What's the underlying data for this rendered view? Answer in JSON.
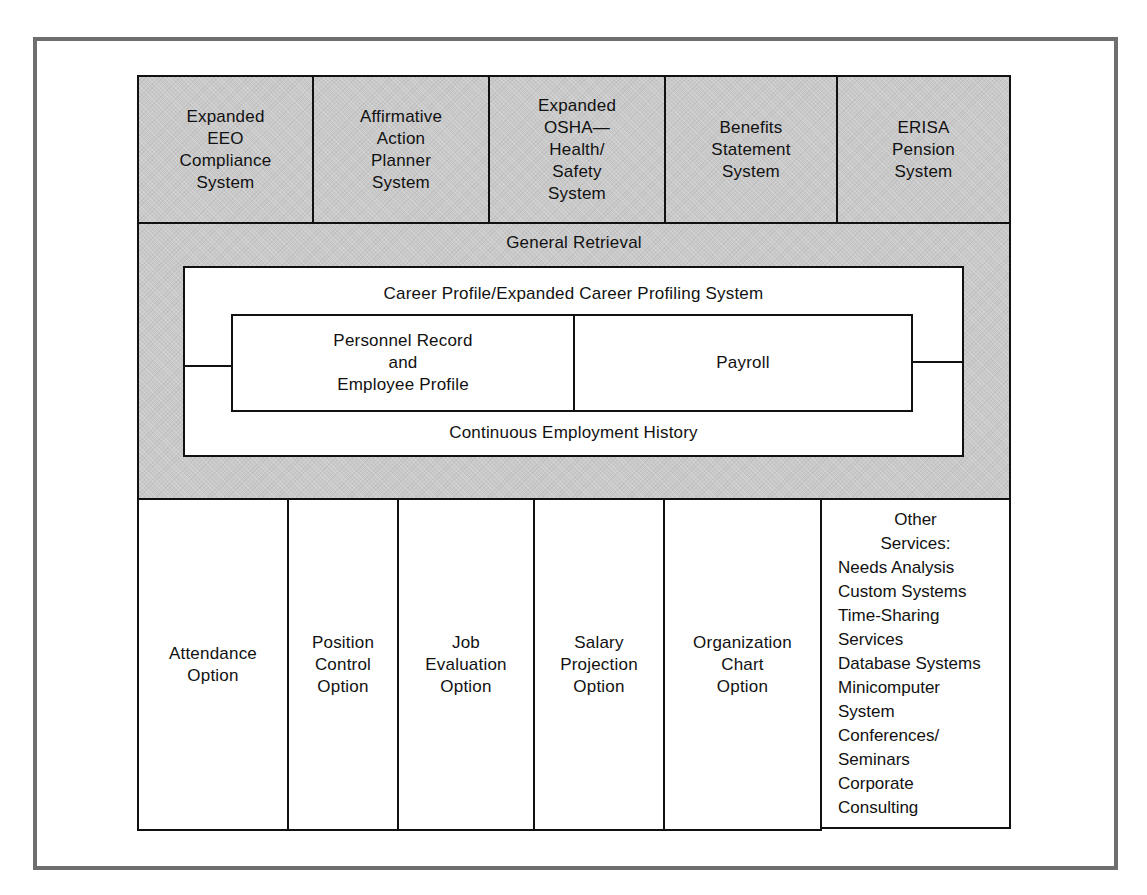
{
  "diagram": {
    "top_row": [
      {
        "label": "Expanded\nEEO\nCompliance\nSystem"
      },
      {
        "label": "Affirmative\nAction\nPlanner\nSystem"
      },
      {
        "label": "Expanded\nOSHA—\nHealth/\nSafety\nSystem"
      },
      {
        "label": "Benefits\nStatement\nSystem"
      },
      {
        "label": "ERISA\nPension\nSystem"
      }
    ],
    "general_retrieval": {
      "label": "General Retrieval"
    },
    "career_profile": {
      "label": "Career Profile/Expanded Career Profiling System"
    },
    "core": {
      "personnel": {
        "label": "Personnel Record\nand\nEmployee Profile"
      },
      "payroll": {
        "label": "Payroll"
      }
    },
    "employment_history": {
      "label": "Continuous Employment History"
    },
    "bottom_row": [
      {
        "label": "Attendance\nOption"
      },
      {
        "label": "Position\nControl\nOption"
      },
      {
        "label": "Job\nEvaluation\nOption"
      },
      {
        "label": "Salary\nProjection\nOption"
      },
      {
        "label": "Organization\nChart\nOption"
      }
    ],
    "other_services": {
      "heading": "Other\nServices:",
      "items": [
        "Needs Analysis",
        "Custom Systems",
        "Time-Sharing",
        "Services",
        "Database Systems",
        "Minicomputer",
        "System",
        "Conferences/",
        "Seminars",
        "Corporate",
        "Consulting"
      ]
    },
    "colors": {
      "shaded_fill": "#c9c9c9",
      "outline": "#111111",
      "frame_border": "#6e6e6e",
      "background": "#ffffff"
    }
  }
}
